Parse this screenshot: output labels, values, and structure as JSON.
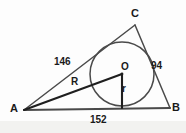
{
  "figure": {
    "kind": "triangle-with-inscribed-circle",
    "background_color": "#fdfdfd",
    "stroke_color": "#3a3a3a",
    "text_color": "#1a1a1a",
    "vertices": {
      "A": {
        "label": "A",
        "x": 24,
        "y": 110
      },
      "B": {
        "label": "B",
        "x": 170,
        "y": 108
      },
      "C": {
        "label": "C",
        "x": 135,
        "y": 25
      }
    },
    "incircle": {
      "center_label": "O",
      "cx": 122,
      "cy": 74,
      "radius": 32
    },
    "segments": {
      "inradius_label": "r",
      "distance_AO_label": "R"
    },
    "side_lengths": {
      "AC": "146",
      "BC": "94",
      "AB": "152"
    }
  }
}
